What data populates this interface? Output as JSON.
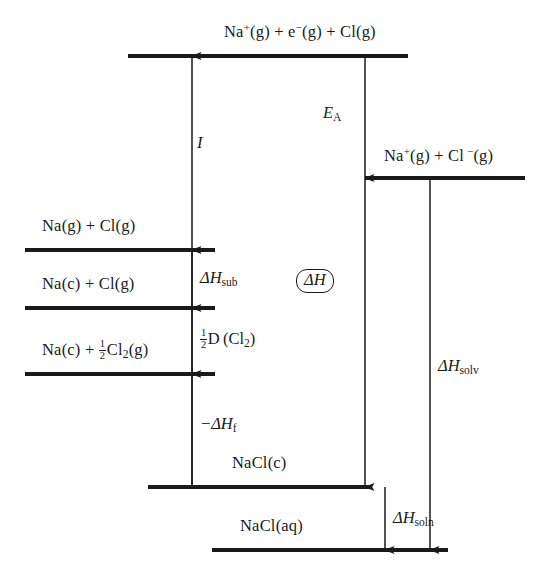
{
  "figure": {
    "background_color": "#ffffff",
    "line_color": "#1a1a1a"
  },
  "levels": [
    {
      "id": "na-plus-e-minus-cl",
      "label": "Na⁺(g) + e⁻(g) + Cl(g)",
      "label_parts": {
        "a": "Na",
        "charge_a": "+",
        "b": "(g) + e",
        "charge_b": "−",
        "c": "(g) + Cl(g)"
      },
      "y": 56,
      "x1": 128,
      "x2": 408
    },
    {
      "id": "na-plus-cl-minus",
      "label": "Na⁺(g) + Cl⁻(g)",
      "label_parts": {
        "a": "Na",
        "charge_a": "+",
        "b": "(g) + Cl",
        "charge_b": "−",
        "c": "(g)"
      },
      "y": 178,
      "x1": 365,
      "x2": 525
    },
    {
      "id": "na-g-cl-g",
      "label": "Na(g) + Cl(g)",
      "y": 250,
      "x1": 25,
      "x2": 215
    },
    {
      "id": "na-c-cl-g",
      "label": "Na(c) + Cl(g)",
      "y": 308,
      "x1": 25,
      "x2": 215
    },
    {
      "id": "na-c-half-cl2-g",
      "label": "Na(c) + ½Cl₂(g)",
      "y": 374,
      "x1": 25,
      "x2": 215
    },
    {
      "id": "nacl-c",
      "label": "NaCl(c)",
      "y": 487,
      "x1": 148,
      "x2": 372
    },
    {
      "id": "nacl-aq",
      "label": "NaCl(aq)",
      "y": 550,
      "x1": 212,
      "x2": 448
    }
  ],
  "arrows": [
    {
      "id": "ionization-energy",
      "symbol": "I",
      "subscript": "",
      "prefix": "",
      "x": 192,
      "y_from": 487,
      "y_to": 56,
      "direction": "up",
      "label_x": 197,
      "label_y": 133
    },
    {
      "id": "enthalpy-sublimation",
      "symbol": "ΔH",
      "subscript": "sub",
      "prefix": "",
      "x": 192,
      "y_from": 308,
      "y_to": 250,
      "direction": "up",
      "label_x": 200,
      "label_y": 268
    },
    {
      "id": "half-dissociation-cl2",
      "symbol": "½D (Cl₂)",
      "subscript": "",
      "prefix": "",
      "x": 192,
      "y_from": 374,
      "y_to": 308,
      "direction": "up",
      "label_x": 200,
      "label_y": 329
    },
    {
      "id": "neg-enthalpy-formation",
      "symbol": "−ΔH",
      "subscript": "f",
      "prefix": "",
      "x": 192,
      "y_from": 487,
      "y_to": 374,
      "direction": "up",
      "label_x": 200,
      "label_y": 414
    },
    {
      "id": "electron-affinity",
      "symbol": "E",
      "subscript": "A",
      "prefix": "",
      "x": 365,
      "y_from": 56,
      "y_to": 178,
      "direction": "down",
      "label_x": 323,
      "label_y": 103
    },
    {
      "id": "enthalpy-lattice",
      "symbol": "ΔH",
      "subscript": "",
      "prefix": "",
      "x": 365,
      "y_from": 178,
      "y_to": 487,
      "direction": "down",
      "label_x": 296,
      "label_y": 269,
      "boxed": true
    },
    {
      "id": "enthalpy-solvation",
      "symbol": "ΔH",
      "subscript": "solv",
      "prefix": "",
      "x": 430,
      "y_from": 178,
      "y_to": 550,
      "direction": "down",
      "label_x": 438,
      "label_y": 356
    },
    {
      "id": "enthalpy-solution",
      "symbol": "ΔH",
      "subscript": "soln",
      "prefix": "",
      "x": 385,
      "y_from": 487,
      "y_to": 550,
      "direction": "down",
      "label_x": 393,
      "label_y": 508
    }
  ],
  "label_positions": {
    "na-plus-e-minus-cl": {
      "x": 224,
      "y": 22
    },
    "na-plus-cl-minus": {
      "x": 384,
      "y": 146
    },
    "na-g-cl-g": {
      "x": 42,
      "y": 216
    },
    "na-c-cl-g": {
      "x": 42,
      "y": 274
    },
    "na-c-half-cl2-g": {
      "x": 42,
      "y": 340
    },
    "nacl-c": {
      "x": 232,
      "y": 453
    },
    "nacl-aq": {
      "x": 240,
      "y": 516
    }
  }
}
